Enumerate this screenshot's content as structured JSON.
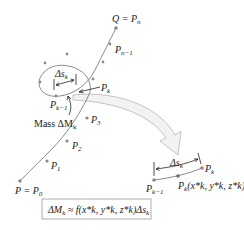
{
  "diagram": {
    "colors": {
      "curve": "#8a8a8a",
      "point": "#8a8a8a",
      "arrow_fill": "#f2f2f2",
      "arrow_stroke": "#b5b5b5",
      "text": "#222222",
      "box_stroke": "#999999"
    },
    "curve_labels": {
      "start": "P = P",
      "start_sub": "0",
      "end": "Q = P",
      "end_sub": "n",
      "p1": "P",
      "p1_sub": "1",
      "p2": "P",
      "p2_sub": "2",
      "p3": "P",
      "p3_sub": "3",
      "pn1": "P",
      "pn1_sub": "n−1",
      "pk": "P",
      "pk_sub": "k",
      "pk1": "P",
      "pk1_sub": "k−1",
      "delta_s": "Δs",
      "delta_s_sub": "k",
      "mass": "Mass ΔM",
      "mass_sub": "k"
    },
    "detail_labels": {
      "pk": "P",
      "pk_sub": "k",
      "pk1": "P",
      "pk1_sub": "k−1",
      "delta_s": "Δs",
      "delta_s_sub": "k",
      "pstar": "P",
      "pstar_sup": "*",
      "pstar_sub": "k",
      "pstar_coords": "(x*k, y*k, z*k)"
    },
    "formula": {
      "lhs": "ΔM",
      "lhs_sub": "k",
      "approx": "≈",
      "rhs": "f(x*k, y*k, z*k)Δs",
      "rhs_sub": "k"
    }
  }
}
